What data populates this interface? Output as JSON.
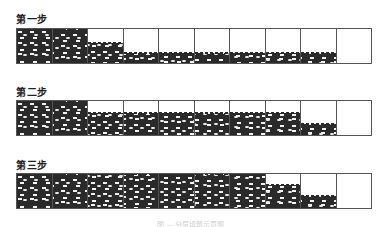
{
  "figure": {
    "steps": [
      {
        "label": "第一步",
        "top": 28,
        "label_top": 11,
        "fill_levels": [
          1.0,
          1.0,
          0.6,
          0.28,
          0.28,
          0.28,
          0.28,
          0.28,
          0.28,
          0.0
        ]
      },
      {
        "label": "第二步",
        "top": 100,
        "label_top": 84,
        "fill_levels": [
          1.0,
          1.0,
          0.65,
          0.65,
          0.65,
          0.65,
          0.65,
          0.65,
          0.32,
          0.0
        ]
      },
      {
        "label": "第三步",
        "top": 173,
        "label_top": 157,
        "fill_levels": [
          1.0,
          1.0,
          1.0,
          1.0,
          1.0,
          1.0,
          1.0,
          0.68,
          0.35,
          0.0
        ]
      }
    ],
    "cells_per_row": 10,
    "colors": {
      "fill": "#2a2a2a",
      "stone": "#f2f2f2",
      "border": "#555555"
    },
    "caption": "图 — 分层填筑示意图"
  }
}
